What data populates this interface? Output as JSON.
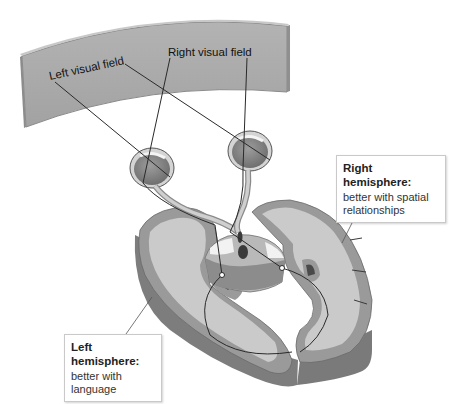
{
  "figure": {
    "screen": {
      "left_label": "Left visual field",
      "right_label": "Right visual field"
    },
    "right_hemisphere": {
      "title": "Right hemisphere:",
      "description_line1": "better with spatial",
      "description_line2": "relationships"
    },
    "left_hemisphere": {
      "title": "Left hemisphere:",
      "description_line1": "better with",
      "description_line2": "language"
    },
    "colors": {
      "screen_fill": "#a9a9a9",
      "screen_edge": "#8a8a8a",
      "cortex_gray": "#9a9a9a",
      "white_matter": "#c9c9c9",
      "slab_side": "#7d7d7d",
      "pathway_line": "#2a2a2a"
    }
  }
}
